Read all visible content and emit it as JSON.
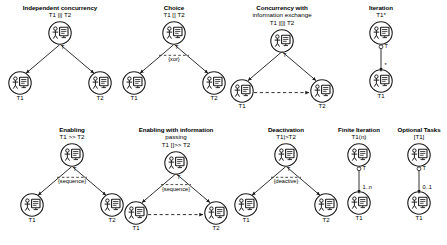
{
  "diagram": {
    "node_icon": "user-task-icon",
    "panels": [
      {
        "id": "independent-concurrency",
        "title": "Independent concurrency",
        "subtitle": "T1 ||| T2",
        "layout": "fork",
        "root_label": "T",
        "edge_label": "",
        "children": [
          "T1",
          "T2"
        ],
        "dashed_link": false
      },
      {
        "id": "choice",
        "title": "Choice",
        "subtitle": "T1 [] T2",
        "layout": "fork",
        "root_label": "T",
        "edge_label": "{xor}",
        "children": [
          "T1",
          "T2"
        ],
        "dashed_link": false
      },
      {
        "id": "concurrency-with-information-exchange",
        "title": "Concurrency with",
        "title2": "information exchange",
        "subtitle": "T1 |[]| T2",
        "layout": "fork",
        "root_label": "T",
        "edge_label": "",
        "children": [
          "T1",
          "T2"
        ],
        "dashed_link": true
      },
      {
        "id": "iteration",
        "title": "Iteration",
        "subtitle": "T1*",
        "layout": "chain",
        "root_label": "T",
        "edge_label": "*",
        "children": [
          "T1"
        ],
        "dashed_link": false
      },
      {
        "id": "enabling",
        "title": "Enabling",
        "subtitle": "T1 >> T2",
        "layout": "fork",
        "root_label": "T",
        "edge_label": "{sequence}",
        "children": [
          "T1",
          "T2"
        ],
        "dashed_link": false
      },
      {
        "id": "enabling-with-information-passing",
        "title": "Enabling with information",
        "title2": "passing",
        "subtitle": "T1 []>> T2",
        "layout": "fork",
        "root_label": "T",
        "edge_label": "{sequence}",
        "children": [
          "T1",
          "T2"
        ],
        "dashed_link": true
      },
      {
        "id": "deactivation",
        "title": "Deactivation",
        "subtitle": "T1|>T2",
        "layout": "fork",
        "root_label": "T",
        "edge_label": "{deactive}",
        "children": [
          "T1",
          "T2"
        ],
        "dashed_link": false
      },
      {
        "id": "finite-iteration",
        "title": "Finite Iteration",
        "subtitle": "T1(n)",
        "layout": "chain",
        "root_label": "T",
        "edge_label": "1..n",
        "children": [
          "T1"
        ],
        "dashed_link": false
      },
      {
        "id": "optional-tasks",
        "title": "Optional Tasks",
        "subtitle": "[T1]",
        "layout": "chain",
        "root_label": "T",
        "edge_label": "0..1",
        "children": [
          "T1"
        ],
        "dashed_link": false
      }
    ],
    "colors": {
      "background": "#ffffff",
      "stroke": "#1a1a1a",
      "text": "#000000"
    }
  }
}
